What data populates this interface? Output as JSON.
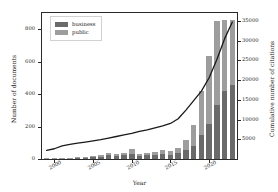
{
  "chart_data": {
    "type": "bar",
    "title": "",
    "xlabel": "Year",
    "ylabel": "Number of documents",
    "y2label": "Cumulative number of citations",
    "grid": false,
    "legend_position": "upper left",
    "xlim": [
      1998.4,
      2023.6
    ],
    "ylim": [
      0,
      900
    ],
    "y2lim": [
      0,
      37000
    ],
    "xticks": [
      2000,
      2005,
      2010,
      2015,
      2020
    ],
    "xticklabels": [
      "2000",
      "2005",
      "2010",
      "2015",
      "2020"
    ],
    "yticks": [
      0,
      200,
      400,
      600,
      800
    ],
    "yticklabels": [
      "0",
      "200",
      "400",
      "600",
      "800"
    ],
    "y2ticks": [
      5000,
      10000,
      15000,
      20000,
      25000,
      30000,
      35000
    ],
    "y2ticklabels": [
      "5000",
      "10000",
      "15000",
      "20000",
      "25000",
      "30000",
      "35000"
    ],
    "categories": [
      1999,
      2000,
      2001,
      2002,
      2003,
      2004,
      2005,
      2006,
      2007,
      2008,
      2009,
      2010,
      2011,
      2012,
      2013,
      2014,
      2015,
      2016,
      2017,
      2018,
      2019,
      2020,
      2021,
      2022,
      2023
    ],
    "series": [
      {
        "name": "business",
        "color": "#6a6a6a",
        "values": [
          3,
          4,
          5,
          6,
          8,
          10,
          12,
          14,
          22,
          18,
          24,
          34,
          20,
          22,
          26,
          30,
          26,
          36,
          54,
          78,
          150,
          215,
          330,
          420,
          455
        ]
      },
      {
        "name": "public",
        "color": "#9d9d9d",
        "values": [
          1,
          2,
          2,
          3,
          4,
          5,
          6,
          8,
          14,
          10,
          14,
          26,
          14,
          16,
          20,
          24,
          22,
          30,
          62,
          130,
          270,
          420,
          520,
          435,
          400
        ]
      }
    ],
    "line_series": {
      "name": "Cumulative number of citations",
      "color": "#1a1a1a",
      "axis": "right",
      "x": [
        1999,
        2000,
        2001,
        2002,
        2003,
        2004,
        2005,
        2006,
        2007,
        2008,
        2009,
        2010,
        2011,
        2012,
        2013,
        2014,
        2015,
        2016,
        2017,
        2018,
        2019,
        2020,
        2021,
        2022,
        2023
      ],
      "values": [
        2200,
        2600,
        3300,
        3700,
        4000,
        4300,
        4600,
        4900,
        5300,
        5700,
        6100,
        6500,
        7000,
        7400,
        7900,
        8400,
        9000,
        10200,
        12400,
        14800,
        17200,
        20600,
        25200,
        30500,
        34700
      ]
    }
  },
  "legend": {
    "items": [
      {
        "label": "business",
        "swatch": "#6a6a6a"
      },
      {
        "label": "public",
        "swatch": "#9d9d9d"
      }
    ]
  }
}
